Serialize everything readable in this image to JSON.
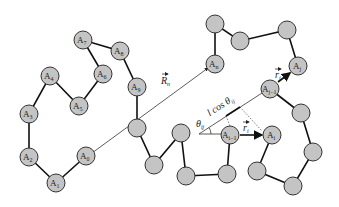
{
  "diagram": {
    "node_labels": {
      "A0": "A",
      "A0_sub": "0",
      "A1": "A",
      "A1_sub": "1",
      "A2": "A",
      "A2_sub": "2",
      "A3": "A",
      "A3_sub": "3",
      "A4": "A",
      "A4_sub": "4",
      "A5": "A",
      "A5_sub": "5",
      "A6": "A",
      "A6_sub": "6",
      "A7": "A",
      "A7_sub": "7",
      "A8": "A",
      "A8_sub": "8",
      "A9": "A",
      "A9_sub": "9",
      "An": "A",
      "An_sub": "n",
      "Aj": "A",
      "Aj_sub": "j",
      "Aj1": "A",
      "Aj1_sub": "j−1",
      "Ai": "A",
      "Ai_sub": "i",
      "Ai1": "A",
      "Ai1_sub": "i−1"
    },
    "vector_labels": {
      "Rn": "R",
      "Rn_sub": "n",
      "ri": "r",
      "ri_sub": "i",
      "rj": "r",
      "rj_sub": "j"
    },
    "angle_label": "θ",
    "angle_sub": "ij",
    "projection_label": "l cos θ",
    "projection_sub": "ij",
    "colors": {
      "node_fill": "#c4c4c4",
      "node_stroke": "#333333",
      "bond": "#111111"
    }
  }
}
